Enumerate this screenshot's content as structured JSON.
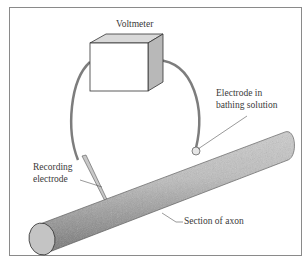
{
  "diagram": {
    "type": "experimental-setup",
    "labels": {
      "voltmeter": "Voltmeter",
      "bath_electrode_line1": "Electrode in",
      "bath_electrode_line2": "bathing solution",
      "recording_electrode_line1": "Recording",
      "recording_electrode_line2": "electrode",
      "axon": "Section of axon"
    },
    "colors": {
      "frame": "#8a8a8a",
      "wire": "#7d7d7d",
      "box_front": "#ffffff",
      "box_side": "#b8b8b8",
      "box_top": "#d9d9d9",
      "axon_body": "#b5b5b5",
      "axon_end": "#c4c4c4",
      "text": "#3a3a3a"
    }
  }
}
